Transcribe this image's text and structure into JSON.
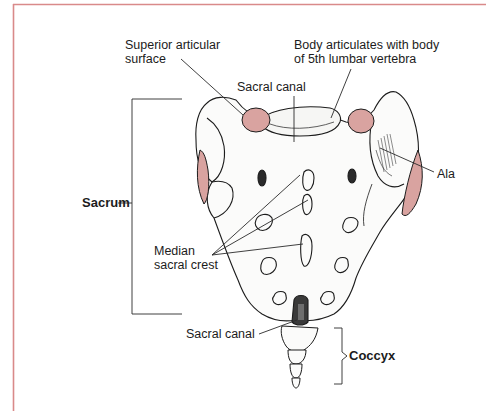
{
  "figure": {
    "frame_color": "#d98a8a",
    "articular_fill": "#d9a3a0",
    "ink_color": "#1c1c1c"
  },
  "labels": {
    "superior_articular_surface": {
      "line1": "Superior articular",
      "line2": "surface"
    },
    "body_articulates": {
      "line1": "Body articulates with body",
      "line2": "of 5th lumbar vertebra"
    },
    "sacral_canal_top": "Sacral canal",
    "ala": "Ala",
    "sacrum": "Sacrum",
    "median_sacral_crest": {
      "line1": "Median",
      "line2": "sacral crest"
    },
    "sacral_canal_bottom": "Sacral canal",
    "coccyx": "Coccyx"
  }
}
